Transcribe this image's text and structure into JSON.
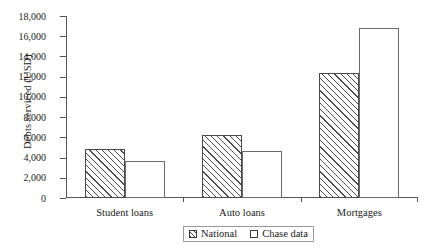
{
  "chart_data": {
    "type": "bar",
    "title": "",
    "xlabel": "",
    "ylabel": "Debts serviced (USD)",
    "categories": [
      "Student loans",
      "Auto loans",
      "Mortgages"
    ],
    "series": [
      {
        "name": "National",
        "values": [
          4850,
          6200,
          12400
        ]
      },
      {
        "name": "Chase data",
        "values": [
          3700,
          4650,
          16800
        ]
      }
    ],
    "ylim": [
      0,
      18000
    ],
    "ytick_values": [
      0,
      2000,
      4000,
      6000,
      8000,
      10000,
      12000,
      14000,
      16000,
      18000
    ],
    "ytick_labels": [
      "0",
      "2,000",
      "4,000",
      "6,000",
      "8,000",
      "10,000",
      "12,000",
      "14,000",
      "16,000",
      "18,000"
    ],
    "grid": false,
    "legend_position": "bottom-center",
    "legend_entries": [
      "National",
      "Chase data"
    ],
    "colors": {
      "national_fill": "#ffffff",
      "national_hatch": "#4a4a4a",
      "chase_fill": "#ffffff",
      "chase_edge": "#6a6a6a",
      "axis": "#555555",
      "text": "#1a1a1a"
    }
  }
}
